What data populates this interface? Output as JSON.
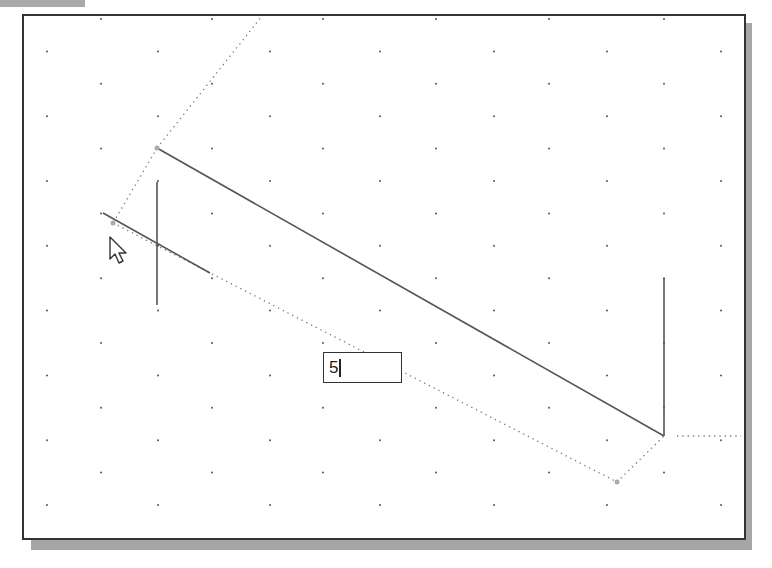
{
  "window": {
    "top_tab_color": "#a9a9a9"
  },
  "canvas": {
    "background": "#ffffff",
    "border_color": "#333333",
    "shadow_color": "#a6a6a6",
    "grid": {
      "dot_color": "#555555",
      "row_a_x": [
        101,
        212,
        323,
        436,
        549,
        664
      ],
      "row_b_x": [
        47,
        158,
        270,
        380,
        494,
        607,
        721
      ],
      "first_row_y": 19,
      "row_step": 32.4,
      "rows": 16
    }
  },
  "sketch": {
    "solid_lines": [
      {
        "name": "main-sloped-line",
        "x1": 157,
        "y1": 148,
        "x2": 664,
        "y2": 436
      },
      {
        "name": "right-vertical-line",
        "x1": 664,
        "y1": 278,
        "x2": 664,
        "y2": 436
      },
      {
        "name": "left-vertical-line",
        "x1": 157,
        "y1": 182,
        "x2": 157,
        "y2": 305
      },
      {
        "name": "short-sloped-line",
        "x1": 103,
        "y1": 213,
        "x2": 210,
        "y2": 273
      }
    ],
    "dotted_lines": [
      {
        "name": "upper-construction-line",
        "x1": 157,
        "y1": 148,
        "x2": 262,
        "y2": 16
      },
      {
        "name": "left-extension-line",
        "x1": 157,
        "y1": 148,
        "x2": 113,
        "y2": 223
      },
      {
        "name": "dimension-line",
        "x1": 113,
        "y1": 223,
        "x2": 617,
        "y2": 482
      },
      {
        "name": "right-extension-line",
        "x1": 617,
        "y1": 482,
        "x2": 664,
        "y2": 436
      },
      {
        "name": "horizontal-reference-line",
        "x1": 677,
        "y1": 436,
        "x2": 741,
        "y2": 436
      }
    ],
    "endpoints": [
      {
        "x": 157,
        "y": 148
      },
      {
        "x": 113,
        "y": 223
      },
      {
        "x": 617,
        "y": 482
      }
    ],
    "line_color": "#555555"
  },
  "dimension_input": {
    "value": "5"
  },
  "cursor": {
    "icon": "arrow-pointer-icon",
    "x": 110,
    "y": 237
  }
}
